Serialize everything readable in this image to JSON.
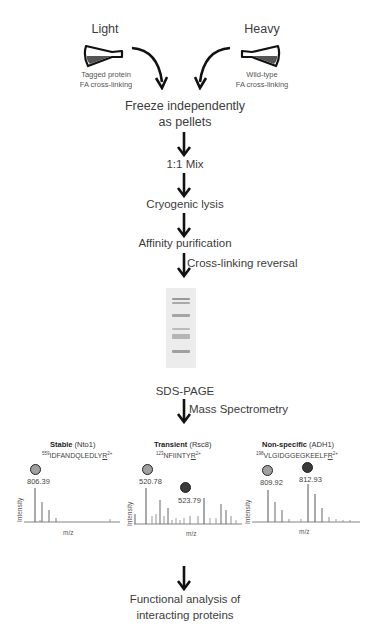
{
  "light": {
    "title": "Light",
    "caption_line1": "Tagged protein",
    "caption_line2": "FA cross-linking"
  },
  "heavy": {
    "title": "Heavy",
    "caption_line1": "Wild-type",
    "caption_line2": "FA cross-linking"
  },
  "steps": {
    "freeze_line1": "Freeze independently",
    "freeze_line2": "as pellets",
    "mix": "1:1 Mix",
    "lysis": "Cryogenic lysis",
    "affinity": "Affinity purification",
    "crosslink_reversal": "Cross-linking reversal",
    "sds_page": "SDS-PAGE",
    "mass_spec": "Mass Spectrometry",
    "final_line1": "Functional analysis of",
    "final_line2": "interacting proteins"
  },
  "spectra": [
    {
      "category": "Stable",
      "protein": "(Nto1)",
      "position": "559",
      "sequence": "IDFANDQLEDLY",
      "last_residue": "R",
      "charge": "2+",
      "light_mz": "806.39",
      "heavy_mz": "",
      "ylabel": "Intensity",
      "xlabel": "m/z"
    },
    {
      "category": "Transient",
      "protein": "(Rsc8)",
      "position": "123",
      "sequence": "NFIINTY",
      "last_residue": "R",
      "charge": "2+",
      "light_mz": "520.78",
      "heavy_mz": "523.79",
      "ylabel": "Intensity",
      "xlabel": "m/z"
    },
    {
      "category": "Non-specific",
      "protein": "(ADH1)",
      "position": "198",
      "sequence": "VLGIDGGEGKEELF",
      "last_residue": "R",
      "charge": "2+",
      "light_mz": "809.92",
      "heavy_mz": "812.93",
      "ylabel": "Intensity",
      "xlabel": "m/z"
    }
  ],
  "colors": {
    "light_dot": "#a0a0a0",
    "heavy_dot": "#3a3a3a",
    "text": "#3c3c3c"
  }
}
